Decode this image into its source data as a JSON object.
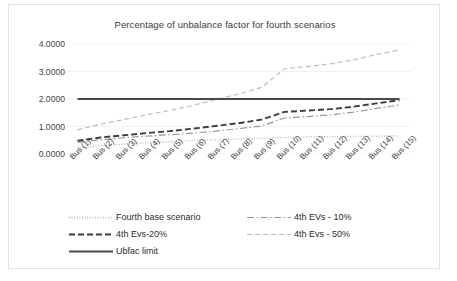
{
  "chart_data": {
    "type": "line",
    "title": "Percentage of unbalance factor for fourth scenarios",
    "xlabel": "",
    "ylabel": "",
    "ylim": [
      0,
      4.0
    ],
    "yticks": [
      "0.0000",
      "1.0000",
      "2.0000",
      "3.0000",
      "4.0000"
    ],
    "ytick_values": [
      0,
      1,
      2,
      3,
      4
    ],
    "grid": true,
    "grid_axis": "y",
    "legend_position": "bottom",
    "categories": [
      "Bus (1)",
      "Bus (2)",
      "Bus (3)",
      "Bus (4)",
      "Bus (5)",
      "Bus (6)",
      "Bus (7)",
      "Bus (8)",
      "Bus (9)",
      "Bus (10)",
      "Bus (11)",
      "Bus (12)",
      "Bus (13)",
      "Bus (14)",
      "Bus (15)"
    ],
    "series": [
      {
        "name": "Fourth base scenario",
        "style": "dotted",
        "color": "#b0b0b0",
        "values": [
          0.22,
          0.3,
          0.36,
          0.41,
          0.45,
          0.49,
          0.52,
          0.55,
          0.57,
          0.6,
          0.62,
          0.63,
          0.64,
          0.65,
          0.66
        ]
      },
      {
        "name": "4th EVs - 10%",
        "style": "dashdot",
        "color": "#9a9a9a",
        "values": [
          0.42,
          0.52,
          0.59,
          0.65,
          0.7,
          0.76,
          0.83,
          0.92,
          1.02,
          1.31,
          1.36,
          1.42,
          1.52,
          1.66,
          1.78
        ]
      },
      {
        "name": "4th Evs-20%",
        "style": "dashed",
        "color": "#3d3d3d",
        "values": [
          0.48,
          0.6,
          0.68,
          0.76,
          0.83,
          0.92,
          1.02,
          1.12,
          1.25,
          1.53,
          1.58,
          1.63,
          1.72,
          1.84,
          1.96
        ]
      },
      {
        "name": "4th Evs - 50%",
        "style": "dashed-light",
        "color": "#bdbdbd",
        "values": [
          0.88,
          1.08,
          1.25,
          1.42,
          1.58,
          1.76,
          1.98,
          2.18,
          2.42,
          3.1,
          3.18,
          3.28,
          3.42,
          3.62,
          3.78
        ]
      },
      {
        "name": "Ubfac limit",
        "style": "solid",
        "color": "#4a4a4a",
        "values": [
          2.0,
          2.0,
          2.0,
          2.0,
          2.0,
          2.0,
          2.0,
          2.0,
          2.0,
          2.0,
          2.0,
          2.0,
          2.0,
          2.0,
          2.0
        ]
      }
    ]
  },
  "legend": {
    "items": [
      {
        "label": "Fourth base scenario",
        "style": "dotted",
        "color": "#b0b0b0"
      },
      {
        "label": "4th EVs - 10%",
        "style": "dashdot",
        "color": "#9a9a9a"
      },
      {
        "label": "4th Evs-20%",
        "style": "dashed",
        "color": "#3d3d3d"
      },
      {
        "label": "4th Evs - 50%",
        "style": "dashed-light",
        "color": "#bdbdbd"
      },
      {
        "label": "Ubfac limit",
        "style": "solid",
        "color": "#4a4a4a"
      }
    ]
  }
}
